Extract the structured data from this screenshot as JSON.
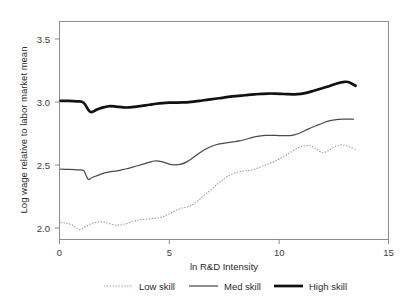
{
  "chart_data": {
    "type": "line",
    "title": "",
    "xlabel": "ln R&D Intensity",
    "ylabel": "Log wage relative to labor market mean",
    "xlim": [
      0,
      15
    ],
    "ylim": [
      1.95,
      3.62
    ],
    "xticks": [
      "0",
      "5",
      "10",
      "15"
    ],
    "xtick_values": [
      0,
      5,
      10,
      15
    ],
    "yticks": [
      "2.0",
      "2.5",
      "3.0",
      "3.5"
    ],
    "ytick_values": [
      2.0,
      2.5,
      3.0,
      3.5
    ],
    "grid": false,
    "legend_position": "below",
    "series": [
      {
        "name": "Low skill",
        "style": "dotted",
        "color": "#9a9a9a",
        "x": [
          0.05,
          0.3,
          0.6,
          0.9,
          1.2,
          1.5,
          1.8,
          2.1,
          2.4,
          2.7,
          3.0,
          3.3,
          3.6,
          3.9,
          4.2,
          4.5,
          4.8,
          5.1,
          5.4,
          5.7,
          6.0,
          6.3,
          6.6,
          6.9,
          7.2,
          7.5,
          7.8,
          8.1,
          8.4,
          8.7,
          9.0,
          9.3,
          9.6,
          9.9,
          10.2,
          10.5,
          10.8,
          11.1,
          11.4,
          11.7,
          12.0,
          12.3,
          12.6,
          12.9,
          13.2,
          13.5
        ],
        "y": [
          2.08,
          2.075,
          2.06,
          2.025,
          2.05,
          2.075,
          2.085,
          2.08,
          2.065,
          2.06,
          2.07,
          2.085,
          2.1,
          2.105,
          2.11,
          2.115,
          2.13,
          2.155,
          2.18,
          2.195,
          2.21,
          2.245,
          2.29,
          2.33,
          2.375,
          2.415,
          2.445,
          2.465,
          2.475,
          2.48,
          2.495,
          2.515,
          2.535,
          2.555,
          2.585,
          2.615,
          2.645,
          2.665,
          2.67,
          2.645,
          2.615,
          2.635,
          2.665,
          2.675,
          2.66,
          2.64
        ]
      },
      {
        "name": "Med skill",
        "style": "solid-thin",
        "color": "#4a4a4a",
        "x": [
          0.05,
          0.4,
          0.8,
          1.1,
          1.3,
          1.5,
          1.8,
          2.1,
          2.4,
          2.7,
          3.0,
          3.3,
          3.6,
          3.9,
          4.2,
          4.4,
          4.7,
          5.0,
          5.2,
          5.5,
          5.8,
          6.1,
          6.4,
          6.7,
          7.0,
          7.3,
          7.6,
          7.9,
          8.2,
          8.5,
          8.8,
          9.1,
          9.4,
          9.7,
          10.0,
          10.3,
          10.6,
          10.9,
          11.2,
          11.5,
          11.8,
          12.1,
          12.4,
          12.7,
          13.0,
          13.4
        ],
        "y": [
          2.49,
          2.487,
          2.483,
          2.478,
          2.412,
          2.425,
          2.445,
          2.462,
          2.472,
          2.478,
          2.49,
          2.503,
          2.517,
          2.532,
          2.547,
          2.553,
          2.545,
          2.528,
          2.522,
          2.525,
          2.545,
          2.578,
          2.615,
          2.645,
          2.668,
          2.682,
          2.69,
          2.697,
          2.705,
          2.718,
          2.732,
          2.742,
          2.748,
          2.748,
          2.746,
          2.745,
          2.748,
          2.762,
          2.785,
          2.808,
          2.828,
          2.848,
          2.862,
          2.87,
          2.872,
          2.872
        ]
      },
      {
        "name": "High skill",
        "style": "solid-thick",
        "color": "#111111",
        "x": [
          0.05,
          0.4,
          0.8,
          1.1,
          1.4,
          1.7,
          2.0,
          2.3,
          2.6,
          2.9,
          3.2,
          3.5,
          3.8,
          4.1,
          4.4,
          4.7,
          5.0,
          5.3,
          5.6,
          5.9,
          6.2,
          6.5,
          6.8,
          7.1,
          7.4,
          7.7,
          8.0,
          8.3,
          8.6,
          8.9,
          9.2,
          9.5,
          9.8,
          10.1,
          10.4,
          10.7,
          11.0,
          11.3,
          11.6,
          11.9,
          12.2,
          12.5,
          12.8,
          13.0,
          13.2,
          13.5
        ],
        "y": [
          3.012,
          3.012,
          3.008,
          2.998,
          2.928,
          2.945,
          2.962,
          2.972,
          2.968,
          2.962,
          2.962,
          2.968,
          2.975,
          2.982,
          2.99,
          2.995,
          2.998,
          2.999,
          3.0,
          3.002,
          3.008,
          3.015,
          3.022,
          3.028,
          3.035,
          3.042,
          3.048,
          3.052,
          3.058,
          3.062,
          3.065,
          3.068,
          3.068,
          3.066,
          3.063,
          3.062,
          3.065,
          3.075,
          3.09,
          3.105,
          3.12,
          3.138,
          3.152,
          3.158,
          3.155,
          3.128
        ]
      }
    ],
    "legend": [
      {
        "label": "Low skill",
        "style": "dotted",
        "color": "#9a9a9a"
      },
      {
        "label": "Med skill",
        "style": "solid-thin",
        "color": "#4a4a4a"
      },
      {
        "label": "High skill",
        "style": "solid-thick",
        "color": "#111111"
      }
    ]
  }
}
